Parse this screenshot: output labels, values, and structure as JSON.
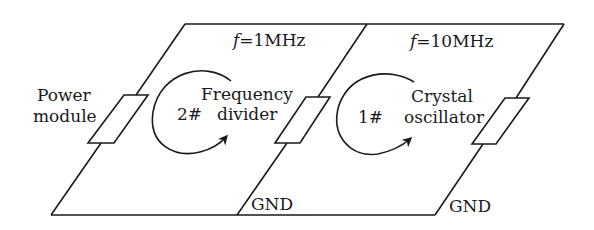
{
  "diagram": {
    "colors": {
      "stroke": "#1a1a1a",
      "background": "#ffffff"
    },
    "boards": [
      {
        "id": "board-2",
        "frequency_var": "f",
        "frequency_value": "=1MHz",
        "number": "2#",
        "name_line1": "Frequency",
        "name_line2": "divider",
        "ground_label": "GND"
      },
      {
        "id": "board-1",
        "frequency_var": "f",
        "frequency_value": "=10MHz",
        "number": "1#",
        "name_line1": "Crystal",
        "name_line2": "oscillator",
        "ground_label": "GND"
      }
    ],
    "power_module": {
      "line1": "Power",
      "line2": "module"
    }
  }
}
